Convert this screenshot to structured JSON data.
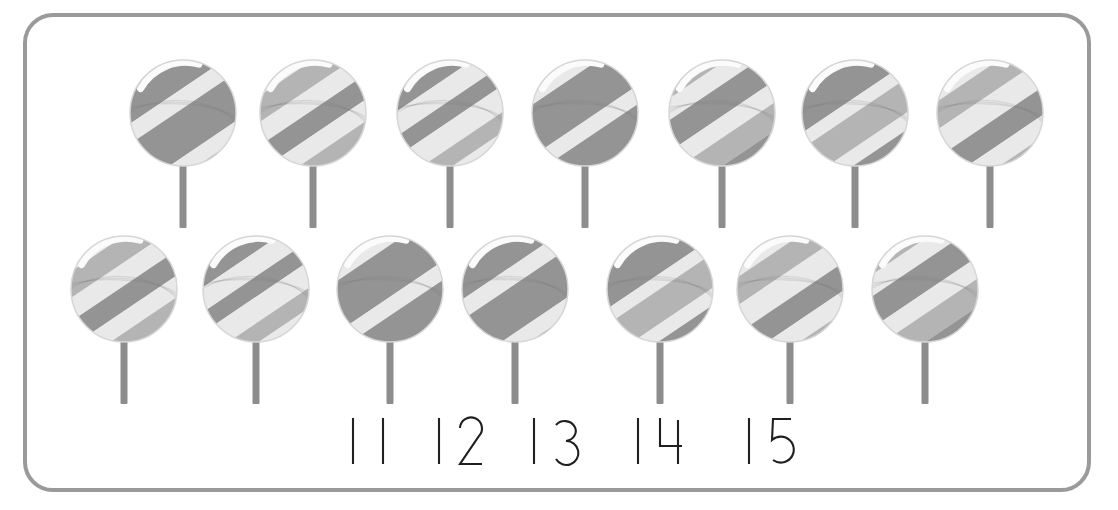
{
  "page": {
    "background_color": "#ffffff",
    "width": 1118,
    "height": 510
  },
  "frame": {
    "name": "rounded-border-frame",
    "stroke_color": "#9a9a9a",
    "stroke_width": 4,
    "corner_radius": 30,
    "x": 23,
    "y": 13,
    "width": 1068,
    "height": 479
  },
  "palette": {
    "candy_dark": "#949494",
    "candy_mid": "#b4b4b4",
    "candy_light": "#e9e9e9",
    "candy_highlight": "#fbfbfb",
    "candy_edge": "#d6d6d6",
    "stick": "#8d8d8d",
    "numeral_ink": "#231f20",
    "frame": "#9a9a9a"
  },
  "counts": {
    "total_lollipops": 14,
    "top_row_count": 7,
    "bottom_row_count": 7
  },
  "lollipops": {
    "radius": 53,
    "stick_width": 7,
    "stick_length": 62,
    "top_row": [
      {
        "id": "lollipop-1",
        "label": "lollipop 1",
        "cx": 183,
        "cy": 113,
        "row": "top",
        "swirl": 0,
        "tone": "dark"
      },
      {
        "id": "lollipop-2",
        "label": "lollipop 2",
        "cx": 313,
        "cy": 113,
        "row": "top",
        "swirl": 1,
        "tone": "mixed"
      },
      {
        "id": "lollipop-3",
        "label": "lollipop 3",
        "cx": 450,
        "cy": 113,
        "row": "top",
        "swirl": 2,
        "tone": "light"
      },
      {
        "id": "lollipop-4",
        "label": "lollipop 4",
        "cx": 585,
        "cy": 113,
        "row": "top",
        "swirl": 3,
        "tone": "dark"
      },
      {
        "id": "lollipop-5",
        "label": "lollipop 5",
        "cx": 722,
        "cy": 113,
        "row": "top",
        "swirl": 4,
        "tone": "mixed"
      },
      {
        "id": "lollipop-6",
        "label": "lollipop 6",
        "cx": 855,
        "cy": 113,
        "row": "top",
        "swirl": 5,
        "tone": "dark"
      },
      {
        "id": "lollipop-7",
        "label": "lollipop 7",
        "cx": 990,
        "cy": 113,
        "row": "top",
        "swirl": 6,
        "tone": "light"
      }
    ],
    "bottom_row": [
      {
        "id": "lollipop-8",
        "label": "lollipop 8",
        "cx": 124,
        "cy": 289,
        "row": "bottom",
        "swirl": 1,
        "tone": "mixed"
      },
      {
        "id": "lollipop-9",
        "label": "lollipop 9",
        "cx": 256,
        "cy": 289,
        "row": "bottom",
        "swirl": 2,
        "tone": "light"
      },
      {
        "id": "lollipop-10",
        "label": "lollipop 10",
        "cx": 390,
        "cy": 289,
        "row": "bottom",
        "swirl": 3,
        "tone": "dark"
      },
      {
        "id": "lollipop-11",
        "label": "lollipop 11",
        "cx": 515,
        "cy": 289,
        "row": "bottom",
        "swirl": 0,
        "tone": "mixed"
      },
      {
        "id": "lollipop-12",
        "label": "lollipop 12",
        "cx": 660,
        "cy": 289,
        "row": "bottom",
        "swirl": 5,
        "tone": "dark"
      },
      {
        "id": "lollipop-13",
        "label": "lollipop 13",
        "cx": 790,
        "cy": 289,
        "row": "bottom",
        "swirl": 6,
        "tone": "light"
      },
      {
        "id": "lollipop-14",
        "label": "lollipop 14",
        "cx": 925,
        "cy": 289,
        "row": "bottom",
        "swirl": 4,
        "tone": "dark"
      }
    ]
  },
  "numerals": [
    {
      "id": "numeral-11",
      "text": "11",
      "x": 342,
      "width": 48
    },
    {
      "id": "numeral-12",
      "text": "12",
      "x": 428,
      "width": 48
    },
    {
      "id": "numeral-13",
      "text": "13",
      "x": 523,
      "width": 48
    },
    {
      "id": "numeral-14",
      "text": "14",
      "x": 627,
      "width": 48
    },
    {
      "id": "numeral-15",
      "text": "15",
      "x": 738,
      "width": 48
    }
  ]
}
